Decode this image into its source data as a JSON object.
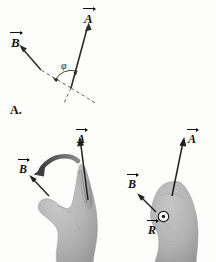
{
  "figure": {
    "part_label": "A.",
    "background_color": "#fdfdfc",
    "ink_color": "#111111",
    "hand_fill": "#b6b6b6",
    "hand_shadow": "#8f8f8f",
    "curved_arrow_color": "#555555"
  },
  "top_diagram": {
    "name": "vector-angle-diagram",
    "vector_a_label": "A",
    "vector_b_label": "B",
    "angle_label": "φ",
    "description_vectors": [
      "A",
      "B"
    ],
    "angle_symbol_name": "phi"
  },
  "left_hand": {
    "name": "left-hand-curl-diagram",
    "vector_a_label": "A",
    "vector_b_label": "B",
    "rotation_arrow_name": "curved-rotation-arrow"
  },
  "right_hand": {
    "name": "right-hand-result-diagram",
    "vector_a_label": "A",
    "vector_b_label": "B",
    "vector_r_label": "R",
    "out_of_page_symbol": "⊙"
  }
}
